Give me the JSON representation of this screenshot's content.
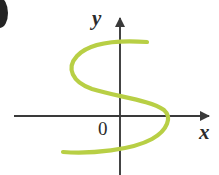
{
  "figure": {
    "kind": "cartesian-graph",
    "background_color": "#ffffff",
    "width": 219,
    "height": 175,
    "origin_label": "0",
    "x_axis_label": "x",
    "y_axis_label": "y",
    "axis_color": "#3a3a3a",
    "curve_color": "#b8cf45",
    "curve_width": 4.2
  },
  "chart_data": {
    "type": "line",
    "title": "",
    "subtitle": "",
    "xlabel": "x",
    "ylabel": "y",
    "legend": [],
    "grid": false,
    "annotations": [
      "0"
    ],
    "axes": {
      "origin_px": [
        120,
        116
      ],
      "x_axis_y_px": 116,
      "y_axis_x_px": 120,
      "x_axis_start_px": 14,
      "x_axis_end_px": 212,
      "y_axis_top_px": 14,
      "y_axis_bottom_px": 175,
      "x_arrow": "right",
      "y_arrow": "up"
    },
    "series": [
      {
        "name": "s-curve",
        "color": "#b8cf45",
        "description": "Sideways S-shaped curve; fails the vertical line test (not a function of x)",
        "points_px": [
          [
            147,
            42
          ],
          [
            128,
            41
          ],
          [
            108,
            42
          ],
          [
            92,
            46
          ],
          [
            80,
            54
          ],
          [
            73,
            64
          ],
          [
            73,
            74
          ],
          [
            80,
            83
          ],
          [
            93,
            89
          ],
          [
            110,
            92
          ],
          [
            130,
            96
          ],
          [
            148,
            101
          ],
          [
            160,
            108
          ],
          [
            166,
            116
          ],
          [
            166,
            126
          ],
          [
            158,
            136
          ],
          [
            143,
            144
          ],
          [
            122,
            149
          ],
          [
            98,
            152
          ],
          [
            78,
            152
          ],
          [
            63,
            152
          ]
        ],
        "path_d": "M 147 42 C 118 40 90 42 77 56 C 66 68 72 82 92 89 C 118 97 150 100 164 110 C 172 117 168 130 152 139 C 132 150 92 154 63 152"
      }
    ]
  },
  "artifacts": {
    "top_left_crop": {
      "name": "cropped-paren-fragment",
      "description": "Partial dark glyph clipped at the left edge of the scan"
    }
  }
}
